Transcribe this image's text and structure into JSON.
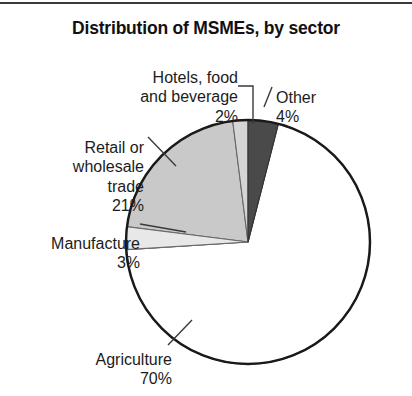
{
  "figure": {
    "title": "Distribution of MSMEs, by sector",
    "has_top_rule": true,
    "background": "#ffffff"
  },
  "chart_data": {
    "type": "pie",
    "title": "Distribution of MSMEs, by sector",
    "xlabel": "",
    "ylabel": "",
    "unit": "percent",
    "start_angle_deg": 0,
    "direction": "clockwise",
    "legend": "none (direct labels with leader lines)",
    "grid": false,
    "categories": [
      "Other",
      "Agriculture",
      "Manufacture",
      "Retail or wholesale trade",
      "Hotels, food and beverage"
    ],
    "values": [
      4,
      70,
      3,
      21,
      2
    ],
    "slices": [
      {
        "name": "Other",
        "label": "Other",
        "value": 4,
        "value_label": "4%",
        "color": "#4a4a4a",
        "start_deg": 0,
        "end_deg": 14.4
      },
      {
        "name": "Agriculture",
        "label": "Agriculture",
        "value": 70,
        "value_label": "70%",
        "color": "#ffffff",
        "start_deg": 14.4,
        "end_deg": 266.4
      },
      {
        "name": "Manufacture",
        "label": "Manufacture",
        "value": 3,
        "value_label": "3%",
        "color": "#e8e8e8",
        "start_deg": 266.4,
        "end_deg": 277.2
      },
      {
        "name": "Retail or wholesale trade",
        "label": "Retail or\nwholesale\ntrade",
        "value": 21,
        "value_label": "21%",
        "color": "#c9c9c9",
        "start_deg": 277.2,
        "end_deg": 352.8
      },
      {
        "name": "Hotels, food and beverage",
        "label": "Hotels, food\nand beverage",
        "value": 2,
        "value_label": "2%",
        "color": "#d5d5d5",
        "start_deg": 352.8,
        "end_deg": 360
      }
    ]
  },
  "labels": {
    "hotels": {
      "text": "Hotels, food\nand beverage",
      "pct": "2%"
    },
    "other": {
      "text": "Other",
      "pct": "4%"
    },
    "retail": {
      "text": "Retail or\nwholesale\ntrade",
      "pct": "21%"
    },
    "manufacture": {
      "text": "Manufacture",
      "pct": "3%"
    },
    "agriculture": {
      "text": "Agriculture",
      "pct": "70%"
    }
  },
  "geometry": {
    "center_x": 248,
    "center_y": 242,
    "radius": 122,
    "outline_color": "#1a1a1a",
    "outline_width": 2.5
  }
}
